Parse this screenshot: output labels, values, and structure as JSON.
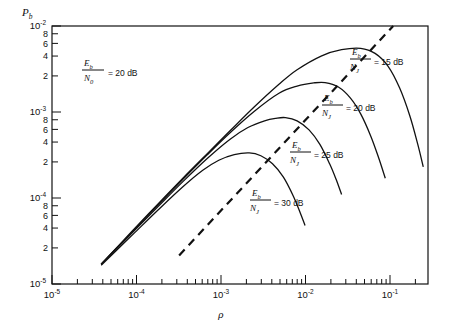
{
  "chart_data": {
    "type": "line",
    "title": "",
    "xlabel": "ρ",
    "ylabel": "P_b",
    "ylabel_main": "P",
    "ylabel_sub": "b",
    "xscale": "log",
    "yscale": "log",
    "xlim": [
      1e-05,
      0.4
    ],
    "ylim": [
      1e-05,
      0.01
    ],
    "grid": false,
    "legend_position": "inline-annotations",
    "x_tick_labels": [
      "10⁻⁵",
      "10⁻⁴",
      "10⁻³",
      "10⁻²",
      "10⁻¹"
    ],
    "x_tick_values": [
      1e-05,
      0.0001,
      0.001,
      0.01,
      0.1
    ],
    "y_tick_labels": [
      "10⁻²",
      "8",
      "6",
      "4",
      "2",
      "10⁻³",
      "8",
      "6",
      "4",
      "2",
      "10⁻⁴",
      "8",
      "6",
      "4",
      "2",
      "10⁻⁵"
    ],
    "y_tick_values": [
      0.01,
      0.008,
      0.006,
      0.004,
      0.002,
      0.001,
      0.0008,
      0.0006,
      0.0004,
      0.0002,
      0.0001,
      8e-05,
      6e-05,
      4e-05,
      2e-05,
      1e-05
    ],
    "global_annotation": {
      "numerator": "E",
      "numerator_sub": "b",
      "denominator": "N",
      "denominator_sub": "0",
      "equals": "= 20 dB"
    },
    "series": [
      {
        "name": "Eb/NJ = 15 dB",
        "label_numerator": "E",
        "label_numerator_sub": "b",
        "label_denominator": "N",
        "label_denominator_sub": "J",
        "label_value": "= 15 dB",
        "peak_x": 0.06,
        "peak_y": 0.0055,
        "points": [
          [
            4e-05,
            1.7e-05
          ],
          [
            6e-05,
            2.55e-05
          ],
          [
            0.0001,
            4.3e-05
          ],
          [
            0.0002,
            8.6e-05
          ],
          [
            0.0004,
            0.00017
          ],
          [
            0.0008,
            0.00033
          ],
          [
            0.0015,
            0.0006
          ],
          [
            0.003,
            0.00115
          ],
          [
            0.006,
            0.0021
          ],
          [
            0.01,
            0.0031
          ],
          [
            0.02,
            0.0045
          ],
          [
            0.035,
            0.0053
          ],
          [
            0.06,
            0.0055
          ],
          [
            0.09,
            0.0048
          ],
          [
            0.13,
            0.0034
          ],
          [
            0.18,
            0.0019
          ],
          [
            0.24,
            0.0009
          ],
          [
            0.3,
            0.00042
          ],
          [
            0.35,
            0.00023
          ]
        ]
      },
      {
        "name": "Eb/NJ = 20 dB",
        "label_numerator": "E",
        "label_numerator_sub": "b",
        "label_denominator": "N",
        "label_denominator_sub": "J",
        "label_value": "= 20 dB",
        "peak_x": 0.022,
        "peak_y": 0.0022,
        "points": [
          [
            4e-05,
            1.7e-05
          ],
          [
            6e-05,
            2.55e-05
          ],
          [
            0.0001,
            4.2e-05
          ],
          [
            0.0002,
            8.4e-05
          ],
          [
            0.0004,
            0.000165
          ],
          [
            0.0008,
            0.00032
          ],
          [
            0.0015,
            0.00057
          ],
          [
            0.003,
            0.00102
          ],
          [
            0.006,
            0.00165
          ],
          [
            0.01,
            0.002
          ],
          [
            0.016,
            0.00218
          ],
          [
            0.022,
            0.0022
          ],
          [
            0.032,
            0.00195
          ],
          [
            0.045,
            0.00145
          ],
          [
            0.06,
            0.00095
          ],
          [
            0.08,
            0.00052
          ],
          [
            0.1,
            0.00029
          ],
          [
            0.12,
            0.00017
          ]
        ]
      },
      {
        "name": "Eb/NJ = 25 dB",
        "label_numerator": "E",
        "label_numerator_sub": "b",
        "label_denominator": "N",
        "label_denominator_sub": "J",
        "label_value": "= 25 dB",
        "peak_x": 0.0072,
        "peak_y": 0.00086,
        "points": [
          [
            4e-05,
            1.7e-05
          ],
          [
            6e-05,
            2.5e-05
          ],
          [
            0.0001,
            4.1e-05
          ],
          [
            0.0002,
            8e-05
          ],
          [
            0.0004,
            0.000155
          ],
          [
            0.0008,
            0.00029
          ],
          [
            0.0015,
            0.00048
          ],
          [
            0.0025,
            0.00066
          ],
          [
            0.004,
            0.00079
          ],
          [
            0.0055,
            0.000845
          ],
          [
            0.0072,
            0.00086
          ],
          [
            0.01,
            0.00079
          ],
          [
            0.014,
            0.00062
          ],
          [
            0.019,
            0.00042
          ],
          [
            0.025,
            0.00025
          ],
          [
            0.03,
            0.000165
          ],
          [
            0.035,
            0.00011
          ]
        ]
      },
      {
        "name": "Eb/NJ = 30 dB",
        "label_numerator": "E",
        "label_numerator_sub": "b",
        "label_denominator": "N",
        "label_denominator_sub": "J",
        "label_value": "= 30 dB",
        "peak_x": 0.0026,
        "peak_y": 0.000335,
        "points": [
          [
            4e-05,
            1.65e-05
          ],
          [
            6e-05,
            2.4e-05
          ],
          [
            0.0001,
            3.85e-05
          ],
          [
            0.0002,
            7.3e-05
          ],
          [
            0.0004,
            0.000135
          ],
          [
            0.0007,
            0.00021
          ],
          [
            0.0011,
            0.000275
          ],
          [
            0.0017,
            0.00032
          ],
          [
            0.0026,
            0.000335
          ],
          [
            0.0036,
            0.00031
          ],
          [
            0.005,
            0.00025
          ],
          [
            0.0068,
            0.000175
          ],
          [
            0.009,
            0.000105
          ],
          [
            0.011,
            6.6e-05
          ],
          [
            0.0125,
            4.8e-05
          ]
        ]
      }
    ],
    "dashed_line": {
      "name": "locus of maxima",
      "style": "dashed",
      "points": [
        [
          0.00036,
          2.15e-05
        ],
        [
          0.15,
          0.01
        ]
      ]
    }
  }
}
